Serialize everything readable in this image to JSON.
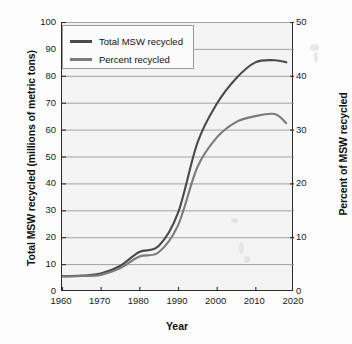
{
  "chart_data": {
    "type": "line",
    "title": "",
    "xlabel": "Year",
    "ylabel": "Total MSW recycled (millions of metric tons)",
    "y2label": "Percent of MSW recycled",
    "xlim": [
      1960,
      2020
    ],
    "ylim": [
      0,
      100
    ],
    "y2lim": [
      0,
      50
    ],
    "grid": true,
    "legend_position": "top-left",
    "xticks": [
      "1960",
      "1970",
      "1980",
      "1990",
      "2000",
      "2010",
      "2020"
    ],
    "yticks_left": [
      "0",
      "10",
      "20",
      "30",
      "40",
      "50",
      "60",
      "70",
      "80",
      "90",
      "100"
    ],
    "yticks_right": [
      "0",
      "10",
      "20",
      "30",
      "40",
      "50"
    ],
    "series": [
      {
        "name": "Total MSW recycled",
        "axis": "left",
        "color": "#4a4a4a",
        "units": "millions of metric tons",
        "x": [
          1960,
          1965,
          1970,
          1975,
          1980,
          1985,
          1990,
          1995,
          2000,
          2005,
          2010,
          2015,
          2018
        ],
        "values": [
          5.5,
          5.7,
          6.5,
          9.3,
          14.5,
          16.7,
          29.0,
          55.0,
          69.5,
          79.0,
          85.0,
          85.8,
          85.0
        ]
      },
      {
        "name": "Percent recycled",
        "axis": "right",
        "color": "#7b7b7b",
        "units": "percent",
        "x": [
          1960,
          1965,
          1970,
          1975,
          1980,
          1985,
          1990,
          1995,
          2000,
          2005,
          2010,
          2015,
          2018
        ],
        "values": [
          2.7,
          2.8,
          3.0,
          4.2,
          6.4,
          7.2,
          12.2,
          23.0,
          28.5,
          31.4,
          32.5,
          32.9,
          31.2
        ]
      }
    ]
  },
  "axes": {
    "left_title": "Total MSW recycled (millions of metric tons)",
    "right_title": "Percent of MSW recycled",
    "x_title": "Year"
  },
  "legend": {
    "items": [
      {
        "label": "Total MSW recycled",
        "color": "#4a4a4a"
      },
      {
        "label": "Percent recycled",
        "color": "#7b7b7b"
      }
    ]
  }
}
